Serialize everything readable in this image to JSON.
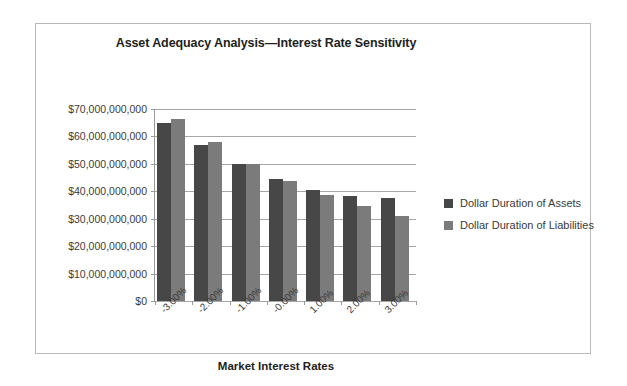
{
  "frame": {
    "border_color": "#b9b9b9",
    "background": "#ffffff"
  },
  "axis_titles": {
    "x": "Market Interest Rates"
  },
  "legend": {
    "position": "right",
    "entries": [
      {
        "label": "Dollar Duration of Assets",
        "color": "#474747",
        "swatch_name": "legend-swatch-assets"
      },
      {
        "label": "Dollar Duration of Liabilities",
        "color": "#7b7b7b",
        "swatch_name": "legend-swatch-liabilities"
      }
    ]
  },
  "chart_data": {
    "type": "bar",
    "title": "Asset Adequacy Analysis—Interest Rate Sensitivity",
    "subtitle": "",
    "xlabel": "Market Interest Rates",
    "ylabel": "",
    "grid": true,
    "legend_position": "right",
    "categories": [
      "-3.00%",
      "-2.00%",
      "-1.00%",
      "-0.00%",
      "1.00%",
      "2.00%",
      "3.00%"
    ],
    "ylim": [
      0,
      70000000000
    ],
    "ytick_step": 10000000000,
    "ytick_labels": [
      "$70,000,000,000",
      "$60,000,000,000",
      "$50,000,000,000",
      "$40,000,000,000",
      "$30,000,000,000",
      "$20,000,000,000",
      "$10,000,000,000",
      "$0"
    ],
    "ytick_values": [
      70000000000,
      60000000000,
      50000000000,
      40000000000,
      30000000000,
      20000000000,
      10000000000,
      0
    ],
    "series": [
      {
        "name": "Dollar Duration of Assets",
        "color": "#474747",
        "values": [
          65000000000,
          56800000000,
          49800000000,
          44500000000,
          40500000000,
          38200000000,
          37400000000
        ]
      },
      {
        "name": "Dollar Duration of Liabilities",
        "color": "#7b7b7b",
        "values": [
          66400000000,
          58000000000,
          50000000000,
          43600000000,
          38800000000,
          34500000000,
          31000000000
        ]
      }
    ]
  }
}
